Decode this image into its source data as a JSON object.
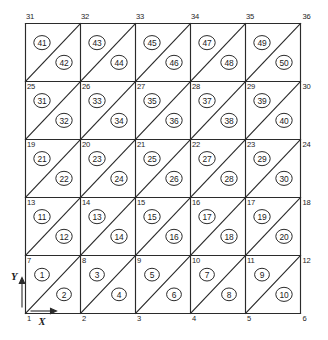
{
  "figure": {
    "axes": {
      "x_label": "X",
      "y_label": "Y"
    },
    "grid": {
      "columns": 5,
      "rows": 5,
      "nodes_per_row": 6,
      "node_rows": 6,
      "total_nodes": 36,
      "total_elements": 50,
      "diagonal_direction": "bottom-left-to-top-right"
    },
    "colors": {
      "line": "#2b2b2b",
      "text": "#1c1c1c",
      "background": "#ffffff"
    },
    "node_labels": [
      {
        "id": 1,
        "text": "1",
        "col": 0,
        "row": 0,
        "anchor": "top-right-of-node"
      },
      {
        "id": 2,
        "text": "2",
        "col": 1,
        "row": 0,
        "anchor": "top-right-of-node"
      },
      {
        "id": 3,
        "text": "3",
        "col": 2,
        "row": 0,
        "anchor": "top-right-of-node"
      },
      {
        "id": 4,
        "text": "4",
        "col": 3,
        "row": 0,
        "anchor": "top-right-of-node"
      },
      {
        "id": 5,
        "text": "5",
        "col": 4,
        "row": 0,
        "anchor": "top-right-of-node"
      },
      {
        "id": 6,
        "text": "6",
        "col": 5,
        "row": 0,
        "anchor": "top-right-of-node"
      },
      {
        "id": 7,
        "text": "7",
        "col": 0,
        "row": 1,
        "anchor": "top-right-of-node"
      },
      {
        "id": 8,
        "text": "8",
        "col": 1,
        "row": 1,
        "anchor": "top-right-of-node"
      },
      {
        "id": 9,
        "text": "9",
        "col": 2,
        "row": 1,
        "anchor": "top-right-of-node"
      },
      {
        "id": 10,
        "text": "10",
        "col": 3,
        "row": 1,
        "anchor": "top-right-of-node"
      },
      {
        "id": 11,
        "text": "11",
        "col": 4,
        "row": 1,
        "anchor": "top-right-of-node"
      },
      {
        "id": 12,
        "text": "12",
        "col": 5,
        "row": 1,
        "anchor": "top-right-of-node"
      },
      {
        "id": 13,
        "text": "13",
        "col": 0,
        "row": 2,
        "anchor": "top-right-of-node"
      },
      {
        "id": 14,
        "text": "14",
        "col": 1,
        "row": 2,
        "anchor": "top-right-of-node"
      },
      {
        "id": 15,
        "text": "15",
        "col": 2,
        "row": 2,
        "anchor": "top-right-of-node"
      },
      {
        "id": 16,
        "text": "16",
        "col": 3,
        "row": 2,
        "anchor": "top-right-of-node"
      },
      {
        "id": 17,
        "text": "17",
        "col": 4,
        "row": 2,
        "anchor": "top-right-of-node"
      },
      {
        "id": 18,
        "text": "18",
        "col": 5,
        "row": 2,
        "anchor": "top-right-of-node"
      },
      {
        "id": 19,
        "text": "19",
        "col": 0,
        "row": 3,
        "anchor": "top-right-of-node"
      },
      {
        "id": 20,
        "text": "20",
        "col": 1,
        "row": 3,
        "anchor": "top-right-of-node"
      },
      {
        "id": 21,
        "text": "21",
        "col": 2,
        "row": 3,
        "anchor": "top-right-of-node"
      },
      {
        "id": 22,
        "text": "22",
        "col": 3,
        "row": 3,
        "anchor": "top-right-of-node"
      },
      {
        "id": 23,
        "text": "23",
        "col": 4,
        "row": 3,
        "anchor": "top-right-of-node"
      },
      {
        "id": 24,
        "text": "24",
        "col": 5,
        "row": 3,
        "anchor": "top-right-of-node"
      },
      {
        "id": 25,
        "text": "25",
        "col": 0,
        "row": 4,
        "anchor": "top-right-of-node"
      },
      {
        "id": 26,
        "text": "26",
        "col": 1,
        "row": 4,
        "anchor": "top-right-of-node"
      },
      {
        "id": 27,
        "text": "27",
        "col": 2,
        "row": 4,
        "anchor": "top-right-of-node"
      },
      {
        "id": 28,
        "text": "28",
        "col": 3,
        "row": 4,
        "anchor": "top-right-of-node"
      },
      {
        "id": 29,
        "text": "29",
        "col": 4,
        "row": 4,
        "anchor": "top-right-of-node"
      },
      {
        "id": 30,
        "text": "30",
        "col": 5,
        "row": 4,
        "anchor": "top-right-of-node"
      },
      {
        "id": 31,
        "text": "31",
        "col": 0,
        "row": 5,
        "anchor": "above-node"
      },
      {
        "id": 32,
        "text": "32",
        "col": 1,
        "row": 5,
        "anchor": "above-node"
      },
      {
        "id": 33,
        "text": "33",
        "col": 2,
        "row": 5,
        "anchor": "above-node"
      },
      {
        "id": 34,
        "text": "34",
        "col": 3,
        "row": 5,
        "anchor": "above-node"
      },
      {
        "id": 35,
        "text": "35",
        "col": 4,
        "row": 5,
        "anchor": "above-node"
      },
      {
        "id": 36,
        "text": "36",
        "col": 5,
        "row": 5,
        "anchor": "above-node"
      }
    ],
    "element_labels": [
      {
        "id": 1,
        "text": "1",
        "cell_col": 0,
        "cell_row": 0,
        "half": "upper-left"
      },
      {
        "id": 2,
        "text": "2",
        "cell_col": 0,
        "cell_row": 0,
        "half": "lower-right"
      },
      {
        "id": 3,
        "text": "3",
        "cell_col": 1,
        "cell_row": 0,
        "half": "upper-left"
      },
      {
        "id": 4,
        "text": "4",
        "cell_col": 1,
        "cell_row": 0,
        "half": "lower-right"
      },
      {
        "id": 5,
        "text": "5",
        "cell_col": 2,
        "cell_row": 0,
        "half": "upper-left"
      },
      {
        "id": 6,
        "text": "6",
        "cell_col": 2,
        "cell_row": 0,
        "half": "lower-right"
      },
      {
        "id": 7,
        "text": "7",
        "cell_col": 3,
        "cell_row": 0,
        "half": "upper-left"
      },
      {
        "id": 8,
        "text": "8",
        "cell_col": 3,
        "cell_row": 0,
        "half": "lower-right"
      },
      {
        "id": 9,
        "text": "9",
        "cell_col": 4,
        "cell_row": 0,
        "half": "upper-left"
      },
      {
        "id": 10,
        "text": "10",
        "cell_col": 4,
        "cell_row": 0,
        "half": "lower-right"
      },
      {
        "id": 11,
        "text": "11",
        "cell_col": 0,
        "cell_row": 1,
        "half": "upper-left"
      },
      {
        "id": 12,
        "text": "12",
        "cell_col": 0,
        "cell_row": 1,
        "half": "lower-right"
      },
      {
        "id": 13,
        "text": "13",
        "cell_col": 1,
        "cell_row": 1,
        "half": "upper-left"
      },
      {
        "id": 14,
        "text": "14",
        "cell_col": 1,
        "cell_row": 1,
        "half": "lower-right"
      },
      {
        "id": 15,
        "text": "15",
        "cell_col": 2,
        "cell_row": 1,
        "half": "upper-left"
      },
      {
        "id": 16,
        "text": "16",
        "cell_col": 2,
        "cell_row": 1,
        "half": "lower-right"
      },
      {
        "id": 17,
        "text": "17",
        "cell_col": 3,
        "cell_row": 1,
        "half": "upper-left"
      },
      {
        "id": 18,
        "text": "18",
        "cell_col": 3,
        "cell_row": 1,
        "half": "lower-right"
      },
      {
        "id": 19,
        "text": "19",
        "cell_col": 4,
        "cell_row": 1,
        "half": "upper-left"
      },
      {
        "id": 20,
        "text": "20",
        "cell_col": 4,
        "cell_row": 1,
        "half": "lower-right"
      },
      {
        "id": 21,
        "text": "21",
        "cell_col": 0,
        "cell_row": 2,
        "half": "upper-left"
      },
      {
        "id": 22,
        "text": "22",
        "cell_col": 0,
        "cell_row": 2,
        "half": "lower-right"
      },
      {
        "id": 23,
        "text": "23",
        "cell_col": 1,
        "cell_row": 2,
        "half": "upper-left"
      },
      {
        "id": 24,
        "text": "24",
        "cell_col": 1,
        "cell_row": 2,
        "half": "lower-right"
      },
      {
        "id": 25,
        "text": "25",
        "cell_col": 2,
        "cell_row": 2,
        "half": "upper-left"
      },
      {
        "id": 26,
        "text": "26",
        "cell_col": 2,
        "cell_row": 2,
        "half": "lower-right"
      },
      {
        "id": 27,
        "text": "27",
        "cell_col": 3,
        "cell_row": 2,
        "half": "upper-left"
      },
      {
        "id": 28,
        "text": "28",
        "cell_col": 3,
        "cell_row": 2,
        "half": "lower-right"
      },
      {
        "id": 29,
        "text": "29",
        "cell_col": 4,
        "cell_row": 2,
        "half": "upper-left"
      },
      {
        "id": 30,
        "text": "30",
        "cell_col": 4,
        "cell_row": 2,
        "half": "lower-right"
      },
      {
        "id": 31,
        "text": "31",
        "cell_col": 0,
        "cell_row": 3,
        "half": "upper-left"
      },
      {
        "id": 32,
        "text": "32",
        "cell_col": 0,
        "cell_row": 3,
        "half": "lower-right"
      },
      {
        "id": 33,
        "text": "33",
        "cell_col": 1,
        "cell_row": 3,
        "half": "upper-left"
      },
      {
        "id": 34,
        "text": "34",
        "cell_col": 1,
        "cell_row": 3,
        "half": "lower-right"
      },
      {
        "id": 35,
        "text": "35",
        "cell_col": 2,
        "cell_row": 3,
        "half": "upper-left"
      },
      {
        "id": 36,
        "text": "36",
        "cell_col": 2,
        "cell_row": 3,
        "half": "lower-right"
      },
      {
        "id": 37,
        "text": "37",
        "cell_col": 3,
        "cell_row": 3,
        "half": "upper-left"
      },
      {
        "id": 38,
        "text": "38",
        "cell_col": 3,
        "cell_row": 3,
        "half": "lower-right"
      },
      {
        "id": 39,
        "text": "39",
        "cell_col": 4,
        "cell_row": 3,
        "half": "upper-left"
      },
      {
        "id": 40,
        "text": "40",
        "cell_col": 4,
        "cell_row": 3,
        "half": "lower-right"
      },
      {
        "id": 41,
        "text": "41",
        "cell_col": 0,
        "cell_row": 4,
        "half": "upper-left"
      },
      {
        "id": 42,
        "text": "42",
        "cell_col": 0,
        "cell_row": 4,
        "half": "lower-right"
      },
      {
        "id": 43,
        "text": "43",
        "cell_col": 1,
        "cell_row": 4,
        "half": "upper-left"
      },
      {
        "id": 44,
        "text": "44",
        "cell_col": 1,
        "cell_row": 4,
        "half": "lower-right"
      },
      {
        "id": 45,
        "text": "45",
        "cell_col": 2,
        "cell_row": 4,
        "half": "upper-left"
      },
      {
        "id": 46,
        "text": "46",
        "cell_col": 2,
        "cell_row": 4,
        "half": "lower-right"
      },
      {
        "id": 47,
        "text": "47",
        "cell_col": 3,
        "cell_row": 4,
        "half": "upper-left"
      },
      {
        "id": 48,
        "text": "48",
        "cell_col": 3,
        "cell_row": 4,
        "half": "lower-right"
      },
      {
        "id": 49,
        "text": "49",
        "cell_col": 4,
        "cell_row": 4,
        "half": "upper-left"
      },
      {
        "id": 50,
        "text": "50",
        "cell_col": 4,
        "cell_row": 4,
        "half": "lower-right"
      }
    ]
  }
}
